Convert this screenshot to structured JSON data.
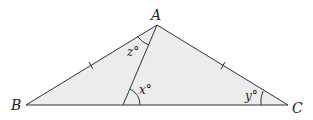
{
  "diagram": {
    "type": "geometry-triangle",
    "colors": {
      "fill": "#ececec",
      "stroke": "#333333"
    },
    "vertices": {
      "A": {
        "label": "A",
        "x": 157,
        "y": 25
      },
      "B": {
        "label": "B",
        "x": 26,
        "y": 105
      },
      "C": {
        "label": "C",
        "x": 288,
        "y": 105
      },
      "D": {
        "label": "",
        "x": 123,
        "y": 105
      }
    },
    "angles": {
      "x": {
        "label": "x°"
      },
      "y": {
        "label": "y°"
      },
      "z": {
        "label": "z°"
      }
    },
    "tick_marks": [
      "AB",
      "AC"
    ]
  }
}
